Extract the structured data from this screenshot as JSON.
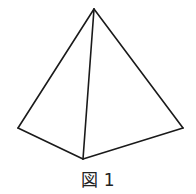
{
  "figure": {
    "caption": "図 1",
    "shape": "triangular pyramid (tetrahedron)",
    "stroke_color": "#1a1a1a",
    "stroke_width": 1.6,
    "vertices": {
      "apex": [
        94,
        9
      ],
      "left": [
        18,
        128
      ],
      "bottom": [
        83,
        159
      ],
      "right": [
        183,
        128
      ]
    },
    "edges": [
      [
        "apex",
        "left"
      ],
      [
        "apex",
        "bottom"
      ],
      [
        "apex",
        "right"
      ],
      [
        "left",
        "bottom"
      ],
      [
        "bottom",
        "right"
      ]
    ]
  }
}
